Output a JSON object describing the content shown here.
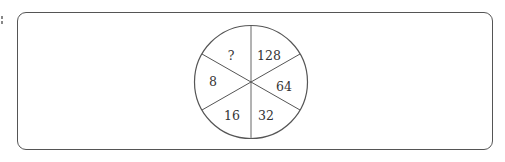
{
  "puzzle": {
    "type": "number-wheel",
    "segments": [
      {
        "position": "top-right",
        "value": "128"
      },
      {
        "position": "right",
        "value": "64"
      },
      {
        "position": "bottom-right",
        "value": "32"
      },
      {
        "position": "bottom-left",
        "value": "16"
      },
      {
        "position": "left",
        "value": "8"
      },
      {
        "position": "top-left",
        "value": "?"
      }
    ]
  },
  "colors": {
    "stroke": "#555555",
    "text": "#333333",
    "background": "#ffffff"
  }
}
